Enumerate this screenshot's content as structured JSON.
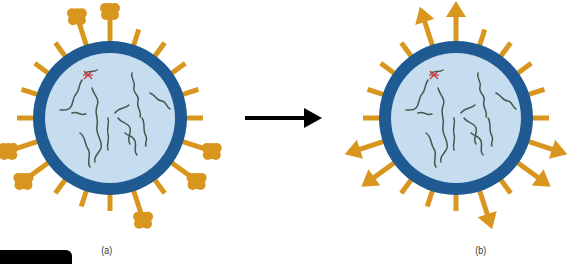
{
  "figure": {
    "panels": [
      {
        "id": "a",
        "label": "(a)",
        "description": "Virus particle with club-shaped surface projections (some spikes with lumpy heads)"
      },
      {
        "id": "b",
        "label": "(b)",
        "description": "Virus particle with arrow-headed surface projections"
      }
    ],
    "transition_arrow": "right-arrow"
  },
  "colors": {
    "capsid_outer": "#1f5a92",
    "capsid_inner": "#c6ddf0",
    "spike": "#d8961e",
    "genome": "#3b5d4c",
    "marker": "#d0303a",
    "arrow": "#000000"
  }
}
